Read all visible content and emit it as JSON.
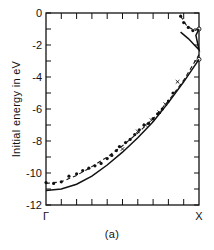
{
  "chart_data": {
    "type": "scatter",
    "title": "",
    "caption": "(a)",
    "xlabel": "",
    "ylabel": "Initial energy in eV",
    "x_ticks": [
      "Γ",
      "X"
    ],
    "xlim": [
      0,
      1
    ],
    "ylim": [
      -12,
      0
    ],
    "y_ticks": [
      0,
      -2,
      -4,
      -6,
      -8,
      -10,
      -12
    ],
    "y_minor_step": 1,
    "x_minor_ticks": 10,
    "grid": false,
    "legend": null,
    "series": [
      {
        "name": "experimental points (filled)",
        "style": "dots",
        "points": [
          [
            0.0,
            -10.6
          ],
          [
            0.05,
            -10.65
          ],
          [
            0.1,
            -10.55
          ],
          [
            0.15,
            -10.2
          ],
          [
            0.2,
            -10.05
          ],
          [
            0.24,
            -9.85
          ],
          [
            0.28,
            -9.7
          ],
          [
            0.32,
            -9.55
          ],
          [
            0.36,
            -9.4
          ],
          [
            0.4,
            -9.1
          ],
          [
            0.43,
            -8.9
          ],
          [
            0.46,
            -8.6
          ],
          [
            0.48,
            -8.35
          ],
          [
            0.52,
            -8.1
          ],
          [
            0.55,
            -7.9
          ],
          [
            0.58,
            -7.6
          ],
          [
            0.61,
            -7.3
          ],
          [
            0.64,
            -7.0
          ],
          [
            0.67,
            -6.9
          ],
          [
            0.7,
            -6.6
          ],
          [
            0.73,
            -6.3
          ],
          [
            0.76,
            -6.0
          ],
          [
            0.8,
            -5.5
          ],
          [
            0.83,
            -5.0
          ],
          [
            0.88,
            -0.2
          ],
          [
            0.9,
            -0.6
          ],
          [
            0.93,
            -0.9
          ],
          [
            0.96,
            -1.1
          ]
        ]
      },
      {
        "name": "experimental points (crosses)",
        "style": "x",
        "points": [
          [
            0.5,
            -8.5
          ],
          [
            0.6,
            -7.4
          ],
          [
            0.65,
            -7.0
          ],
          [
            0.69,
            -6.7
          ],
          [
            0.74,
            -6.2
          ],
          [
            0.78,
            -5.7
          ],
          [
            0.86,
            -4.3
          ]
        ]
      },
      {
        "name": "experimental points (open)",
        "style": "open",
        "points": [
          [
            1.0,
            -1.0
          ],
          [
            1.0,
            -2.9
          ]
        ]
      },
      {
        "name": "dashed fit curve",
        "style": "dashed",
        "points": [
          [
            0.0,
            -10.65
          ],
          [
            0.1,
            -10.55
          ],
          [
            0.2,
            -10.15
          ],
          [
            0.3,
            -9.6
          ],
          [
            0.4,
            -9.0
          ],
          [
            0.5,
            -8.3
          ],
          [
            0.6,
            -7.5
          ],
          [
            0.7,
            -6.6
          ],
          [
            0.8,
            -5.5
          ],
          [
            0.9,
            -4.2
          ],
          [
            1.0,
            -2.6
          ]
        ]
      },
      {
        "name": "dashed fit upper branch",
        "style": "dashed",
        "points": [
          [
            0.88,
            -0.2
          ],
          [
            0.92,
            -0.8
          ],
          [
            0.97,
            -1.1
          ],
          [
            1.0,
            -1.0
          ]
        ]
      },
      {
        "name": "solid theory curve",
        "style": "solid",
        "points": [
          [
            0.0,
            -11.1
          ],
          [
            0.1,
            -11.0
          ],
          [
            0.2,
            -10.7
          ],
          [
            0.3,
            -10.2
          ],
          [
            0.4,
            -9.5
          ],
          [
            0.5,
            -8.7
          ],
          [
            0.6,
            -7.8
          ],
          [
            0.7,
            -6.8
          ],
          [
            0.8,
            -5.6
          ],
          [
            0.9,
            -4.3
          ],
          [
            1.0,
            -2.9
          ]
        ]
      },
      {
        "name": "solid theory upper branch",
        "style": "solid",
        "points": [
          [
            0.88,
            -1.2
          ],
          [
            0.93,
            -1.6
          ],
          [
            0.97,
            -2.0
          ],
          [
            1.0,
            -2.3
          ],
          [
            0.98,
            -1.4
          ],
          [
            1.0,
            -1.0
          ]
        ]
      }
    ]
  },
  "axes": {
    "y_tick_labels": [
      "0",
      "-2",
      "-4",
      "-6",
      "-8",
      "-10",
      "-12"
    ],
    "x_left_label": "Γ",
    "x_right_label": "X"
  },
  "labels": {
    "ylabel": "Initial energy in eV",
    "caption": "(a)"
  }
}
